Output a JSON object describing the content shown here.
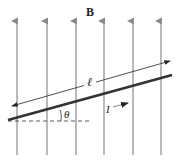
{
  "labels": {
    "field": "B",
    "length": "ℓ",
    "angle": "θ",
    "current": "I"
  },
  "colors": {
    "field_lines": "#8a8a8a",
    "wire": "#333333",
    "text": "#222222"
  },
  "field_lines_x": [
    17,
    47,
    76,
    104,
    133,
    161
  ]
}
